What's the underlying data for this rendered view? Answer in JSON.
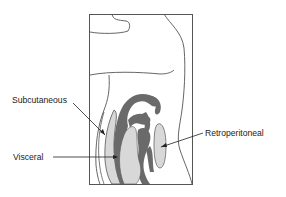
{
  "diagram": {
    "type": "anatomical-cross-section",
    "labels": {
      "subcutaneous": "Subcutaneous",
      "visceral": "Visceral",
      "retroperitoneal": "Retroperitoneal"
    },
    "colors": {
      "outline": "#555555",
      "dark_fill": "#6a6a6a",
      "light_fill": "#d8d8d8",
      "background": "#ffffff"
    }
  }
}
